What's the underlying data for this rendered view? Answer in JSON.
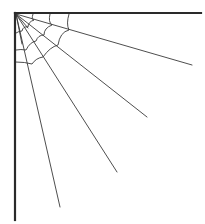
{
  "illustration": {
    "subject": "spider-web-corner",
    "stroke_color": "#333333",
    "frame_color": "#2a2a2a",
    "background": "#ffffff",
    "frame": {
      "top": {
        "x1": 15,
        "y1": 13,
        "x2": 201,
        "y2": 13
      },
      "left": {
        "x1": 15,
        "y1": 13,
        "x2": 15,
        "y2": 220
      }
    },
    "origin": {
      "x": 16,
      "y": 14
    },
    "rays": [
      {
        "x2": 192,
        "y2": 65
      },
      {
        "x2": 147,
        "y2": 117
      },
      {
        "x2": 117,
        "y2": 172
      },
      {
        "x2": 60,
        "y2": 207
      }
    ],
    "inner_rays": [
      {
        "x2": 33,
        "y2": 14
      },
      {
        "x2": 50,
        "y2": 14
      },
      {
        "x2": 69,
        "y2": 14
      },
      {
        "x2": 16,
        "y2": 30
      },
      {
        "x2": 16,
        "y2": 50
      },
      {
        "x2": 16,
        "y2": 62
      }
    ]
  }
}
